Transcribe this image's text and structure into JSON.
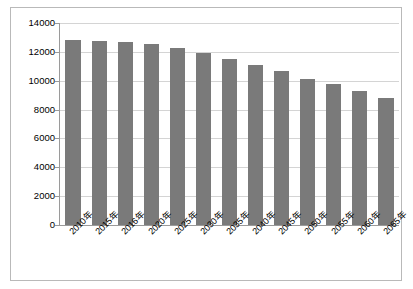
{
  "chart_data": {
    "type": "bar",
    "title": "",
    "xlabel": "",
    "ylabel": "",
    "ylim": [
      0,
      14000
    ],
    "y_ticks": [
      "0",
      "2000",
      "4000",
      "6000",
      "8000",
      "10000",
      "12000",
      "14000"
    ],
    "y_tick_values": [
      0,
      2000,
      4000,
      6000,
      8000,
      10000,
      12000,
      14000
    ],
    "grid": true,
    "legend": "none",
    "bar_color": "#7a7a7a",
    "categories": [
      "2010年",
      "2015年",
      "2016年",
      "2020年",
      "2025年",
      "2030年",
      "2035年",
      "2040年",
      "2045年",
      "2050年",
      "2055年",
      "2060年",
      "2065年"
    ],
    "values": [
      12800,
      12750,
      12700,
      12550,
      12250,
      11900,
      11500,
      11100,
      10650,
      10150,
      9750,
      9300,
      8800
    ]
  }
}
